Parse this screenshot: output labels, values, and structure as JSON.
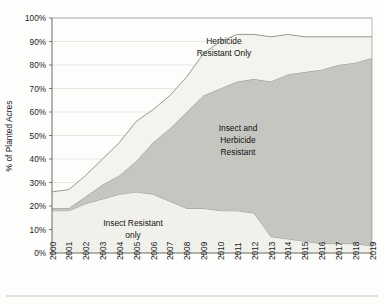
{
  "chart": {
    "type": "area",
    "title": "",
    "ylabel": "% of Planted Acres",
    "xlabel": ""
  },
  "chart_data": {
    "type": "area",
    "stacked": true,
    "title": "",
    "xlabel": "",
    "ylabel": "% of Planted Acres",
    "ylim": [
      0,
      100
    ],
    "xlim": [
      2000,
      2019
    ],
    "grid": true,
    "legend_position": "inline-annotations",
    "unit": "percent",
    "x": [
      2000,
      2001,
      2002,
      2003,
      2004,
      2005,
      2006,
      2007,
      2008,
      2009,
      2010,
      2011,
      2012,
      2013,
      2014,
      2015,
      2016,
      2017,
      2018,
      2019
    ],
    "categories": [
      "2000",
      "2001",
      "2002",
      "2003",
      "2004",
      "2005",
      "2006",
      "2007",
      "2008",
      "2009",
      "2010",
      "2011",
      "2012",
      "2013",
      "2014",
      "2015",
      "2016",
      "2017",
      "2018",
      "2019"
    ],
    "series": [
      {
        "name": "Insect Resistant only",
        "color": "#f1f1ec",
        "values": [
          18,
          18,
          21,
          23,
          25,
          26,
          25,
          22,
          19,
          19,
          18,
          18,
          17,
          7,
          6,
          5,
          4,
          4,
          4,
          3
        ]
      },
      {
        "name": "Insect and Herbicide Resistant",
        "color": "#c6c6c0",
        "values": [
          1,
          1,
          3,
          6,
          8,
          13,
          22,
          31,
          41,
          48,
          52,
          55,
          57,
          66,
          70,
          72,
          74,
          76,
          77,
          80
        ]
      },
      {
        "name": "Herbicide Resistant Only",
        "color": "#f4f4ef",
        "values": [
          7,
          8,
          9,
          11,
          14,
          17,
          14,
          14,
          15,
          18,
          20,
          20,
          19,
          19,
          17,
          15,
          14,
          12,
          11,
          9
        ]
      }
    ],
    "cumulative_top": [
      26,
      27,
      33,
      40,
      47,
      56,
      61,
      67,
      75,
      85,
      90,
      93,
      93,
      92,
      93,
      92,
      92,
      92,
      92,
      92
    ],
    "annotations": [
      {
        "text": "Herbicide Resistant Only",
        "x_year": 2009,
        "y_percent": 77
      },
      {
        "text": "Insect and Herbicide Resistant",
        "x_year": 2010,
        "y_percent": 45
      },
      {
        "text": "Insect Resistant only",
        "x_year": 2006,
        "y_percent": 12
      }
    ],
    "yticks": [
      "0%",
      "10%",
      "20%",
      "30%",
      "40%",
      "50%",
      "60%",
      "70%",
      "80%",
      "90%",
      "100%"
    ],
    "ytick_values": [
      0,
      10,
      20,
      30,
      40,
      50,
      60,
      70,
      80,
      90,
      100
    ]
  },
  "yaxis": {
    "title": "% of Planted Acres",
    "ticks": [
      "100%",
      "90%",
      "80%",
      "70%",
      "60%",
      "50%",
      "40%",
      "30%",
      "20%",
      "10%",
      "0%"
    ]
  },
  "xaxis": {
    "ticks": [
      "2000",
      "2001",
      "2002",
      "2003",
      "2004",
      "2005",
      "2006",
      "2007",
      "2008",
      "2009",
      "2010",
      "2011",
      "2012",
      "2013",
      "2014",
      "2015",
      "2016",
      "2017",
      "2018",
      "2019"
    ]
  },
  "labels": {
    "herbicide_only_line1": "Herbicide",
    "herbicide_only_line2": "Resistant Only",
    "stacked_line1": "Insect and",
    "stacked_line2": "Herbicide",
    "stacked_line3": "Resistant",
    "insect_only_line1": "Insect Resistant",
    "insect_only_line2": "only"
  },
  "colors": {
    "band_insect_only": "#f1f1ec",
    "band_both": "#c6c6c0",
    "band_herbicide_only": "#f4f4ef",
    "axis": "#5a5a58",
    "grid": "#d8d8d4",
    "text": "#1a1a1a",
    "background": "#fdfdfc"
  }
}
